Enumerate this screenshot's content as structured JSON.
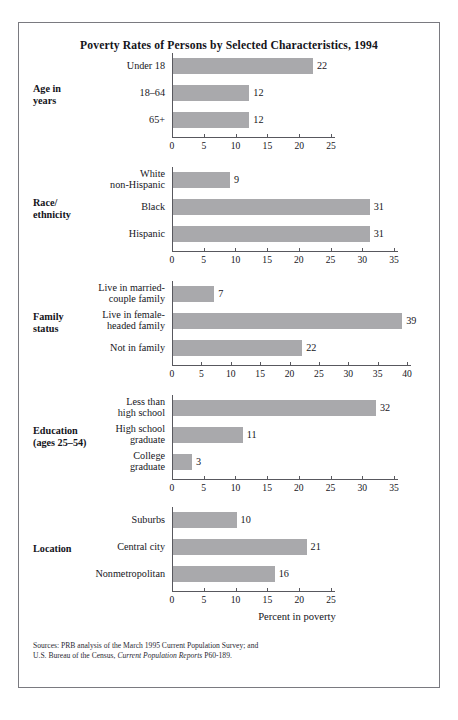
{
  "title": "Poverty Rates of Persons by Selected Characteristics, 1994",
  "axis_title": "Percent in poverty",
  "sources": {
    "line1": "Sources: PRB analysis of the March 1995 Current Population Survey; and",
    "line2_pre": "U.S. Bureau of the Census, ",
    "line2_italic": "Current Population Reports",
    "line2_post": " P60-189."
  },
  "colors": {
    "bar": "#a9a9ac",
    "axis": "#58585e",
    "frame": "#7a7a80",
    "text": "#16161c",
    "background": "#ffffff"
  },
  "chart_data": {
    "type": "bar",
    "orientation": "horizontal",
    "title": "Poverty Rates of Persons by Selected Characteristics, 1994",
    "xlabel": "Percent in poverty",
    "ylabel": "",
    "grid": false,
    "legend": "none",
    "panels": [
      {
        "group": "Age in\nyears",
        "group_line1": "Age in",
        "group_line2": "years",
        "categories": [
          "Under 18",
          "18–64",
          "65+"
        ],
        "values": [
          22,
          12,
          12
        ],
        "xlim": [
          0,
          25
        ],
        "xticks": [
          0,
          5,
          10,
          15,
          20,
          25
        ]
      },
      {
        "group": "Race/\nethnicity",
        "group_line1": "Race/",
        "group_line2": "ethnicity",
        "categories": [
          "White\nnon-Hispanic",
          "Black",
          "Hispanic"
        ],
        "values": [
          9,
          31,
          31
        ],
        "xlim": [
          0,
          35
        ],
        "xticks": [
          0,
          5,
          10,
          15,
          20,
          25,
          30,
          35
        ]
      },
      {
        "group": "Family\nstatus",
        "group_line1": "Family",
        "group_line2": "status",
        "categories": [
          "Live in married-\ncouple family",
          "Live in female-\nheaded family",
          "Not in family"
        ],
        "values": [
          7,
          39,
          22
        ],
        "xlim": [
          0,
          40
        ],
        "xticks": [
          0,
          5,
          10,
          15,
          20,
          25,
          30,
          35,
          40
        ]
      },
      {
        "group": "Education\n(ages 25–54)",
        "group_line1": "Education",
        "group_line2": "(ages 25–54)",
        "categories": [
          "Less than\nhigh school",
          "High school\ngraduate",
          "College\ngraduate"
        ],
        "values": [
          32,
          11,
          3
        ],
        "xlim": [
          0,
          35
        ],
        "xticks": [
          0,
          5,
          10,
          15,
          20,
          25,
          30,
          35
        ]
      },
      {
        "group": "Location",
        "group_line1": "Location",
        "group_line2": "",
        "categories": [
          "Suburbs",
          "Central city",
          "Nonmetropolitan"
        ],
        "values": [
          10,
          21,
          16
        ],
        "xlim": [
          0,
          25
        ],
        "xticks": [
          0,
          5,
          10,
          15,
          20,
          25
        ]
      }
    ]
  }
}
